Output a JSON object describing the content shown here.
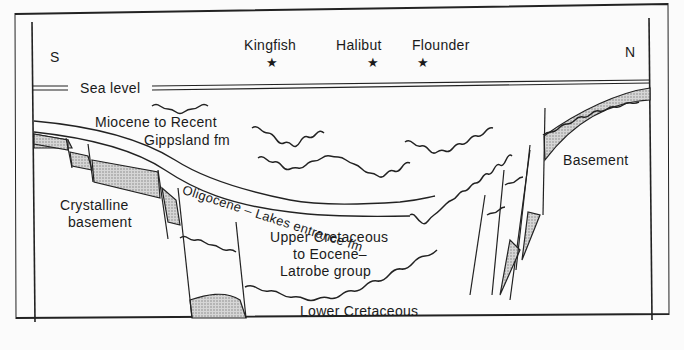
{
  "diagram": {
    "type": "geological-cross-section",
    "orientation": {
      "left": "S",
      "right": "N"
    },
    "wells": [
      {
        "name": "Kingfish",
        "icon": "star-icon"
      },
      {
        "name": "Halibut",
        "icon": "star-icon"
      },
      {
        "name": "Flounder",
        "icon": "star-icon"
      }
    ],
    "sea_level_label": "Sea level",
    "units": {
      "miocene_line1": "Miocene to Recent",
      "miocene_line2": "Gippsland fm",
      "oligocene": "Oligocene – Lakes entrance fm",
      "upper_cret_line1": "Upper Cretaceous",
      "upper_cret_line2": "to Eocene–",
      "upper_cret_line3": "Latrobe group",
      "lower_cret": "Lower Cretaceous",
      "crystalline_line1": "Crystalline",
      "crystalline_line2": "basement",
      "basement": "Basement"
    },
    "colors": {
      "ink": "#1a1a1a",
      "paper": "#fbfbfb",
      "shade": "#bdbdbd"
    }
  }
}
